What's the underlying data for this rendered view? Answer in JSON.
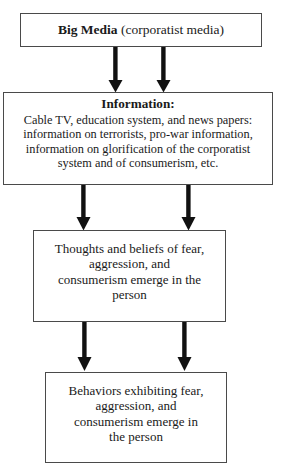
{
  "diagram": {
    "type": "flowchart",
    "orientation": "top-to-bottom",
    "background_color": "#ffffff",
    "line_color": "#4a4a4a",
    "arrow_color": "#111111",
    "text_color": "#1a1a1a",
    "nodes": [
      {
        "id": "big-media",
        "emphasis_text": "Big Media",
        "rest_text": " (corporatist media)",
        "full_text": "Big Media (corporatist media)"
      },
      {
        "id": "information",
        "heading": "Information:",
        "lines": [
          "Cable TV, education system, and news papers:",
          "information on terrorists, pro-war information,",
          "information on glorification of the corporatist",
          "system and of consumerism, etc."
        ]
      },
      {
        "id": "thoughts",
        "lines": [
          "Thoughts and beliefs of fear,",
          "aggression, and",
          "consumerism emerge in the",
          "person"
        ]
      },
      {
        "id": "behaviors",
        "lines": [
          "Behaviors exhibiting fear,",
          "aggression, and",
          "consumerism emerge in",
          "the person"
        ]
      }
    ],
    "arrow_groups": [
      {
        "id": "big-media-to-information",
        "count": 2,
        "direction": "down"
      },
      {
        "id": "information-to-thoughts",
        "count": 2,
        "direction": "down"
      },
      {
        "id": "thoughts-to-behaviors",
        "count": 2,
        "direction": "down"
      }
    ]
  }
}
